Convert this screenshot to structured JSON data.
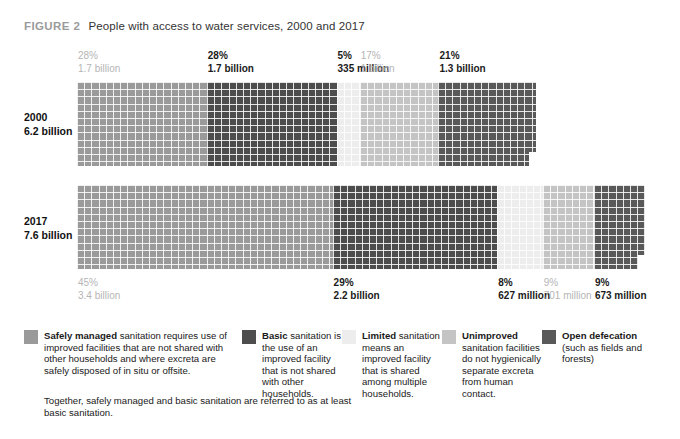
{
  "figure": {
    "label": "FIGURE 2",
    "title": "People with access to water services, 2000 and 2017"
  },
  "colors": {
    "safely_managed": "#9a9a9a",
    "basic": "#4d4d4d",
    "limited": "#ededed",
    "unimproved": "#c4c4c4",
    "open_defecation": "#595959",
    "grid_line": "#ffffff",
    "muted_text": "#b5b5b5",
    "body_text": "#1a1a1a",
    "fig_label": "#9b9b9b"
  },
  "rows": [
    {
      "year": "2000",
      "total": "6.2 billion",
      "labels_position": "top",
      "segments": [
        {
          "key": "safely_managed",
          "label_pct": "28%",
          "label_num": "1.7 billion",
          "value": 28,
          "muted": true
        },
        {
          "key": "basic",
          "label_pct": "28%",
          "label_num": "1.7 billion",
          "value": 28,
          "muted": false
        },
        {
          "key": "limited",
          "label_pct": "5%",
          "label_num": "335 million",
          "value": 5,
          "muted": false
        },
        {
          "key": "unimproved",
          "label_pct": "17%",
          "label_num": "1 billion",
          "value": 17,
          "muted": true
        },
        {
          "key": "open_defecation",
          "label_pct": "21%",
          "label_num": "1.3 billion",
          "value": 21,
          "muted": false
        }
      ]
    },
    {
      "year": "2017",
      "total": "7.6 billion",
      "labels_position": "bottom",
      "segments": [
        {
          "key": "safely_managed",
          "label_pct": "45%",
          "label_num": "3.4 billion",
          "value": 45,
          "muted": true
        },
        {
          "key": "basic",
          "label_pct": "29%",
          "label_num": "2.2 billion",
          "value": 29,
          "muted": false
        },
        {
          "key": "limited",
          "label_pct": "8%",
          "label_num": "627 million",
          "value": 8,
          "muted": false
        },
        {
          "key": "unimproved",
          "label_pct": "9%",
          "label_num": "701 million",
          "value": 9,
          "muted": true
        },
        {
          "key": "open_defecation",
          "label_pct": "9%",
          "label_num": "673 million",
          "value": 9,
          "muted": false
        }
      ]
    }
  ],
  "legend": [
    {
      "key": "safely_managed",
      "color": "#9a9a9a",
      "bold": "Safely managed",
      "rest": "",
      "body": "sanitation requires use of improved facilities that are not shared with other households and where excreta are safely disposed of in situ or offsite."
    },
    {
      "key": "basic",
      "color": "#4d4d4d",
      "bold": "Basic",
      "rest": " sanitation",
      "body": "is the use of an improved facility that is not shared with other households."
    },
    {
      "key": "limited",
      "color": "#ededed",
      "bold": "Limited",
      "rest": " sanitation",
      "body": "means an improved facility that is shared among multiple households."
    },
    {
      "key": "unimproved",
      "color": "#c4c4c4",
      "bold": "Unimproved",
      "rest": "",
      "body": "sanitation facilities do not hygienically separate excreta from human contact."
    },
    {
      "key": "open_defecation",
      "color": "#595959",
      "bold": "Open defecation",
      "rest": "",
      "body": "(such as fields and forests)"
    }
  ],
  "legend_note": "Together, safely managed and basic sanitation are referred to as at least basic sanitation.",
  "chart_data": {
    "type": "bar",
    "title": "People with access to water services, 2000 and 2017",
    "xlabel": "",
    "ylabel": "",
    "orientation": "horizontal-stacked-waffle",
    "categories": [
      "2000",
      "2017"
    ],
    "category_totals": [
      "6.2 billion",
      "7.6 billion"
    ],
    "series": [
      {
        "name": "Safely managed",
        "values": [
          28,
          45
        ],
        "labels": [
          "1.7 billion",
          "3.4 billion"
        ],
        "color": "#9a9a9a"
      },
      {
        "name": "Basic",
        "values": [
          28,
          29
        ],
        "labels": [
          "1.7 billion",
          "2.2 billion"
        ],
        "color": "#4d4d4d"
      },
      {
        "name": "Limited",
        "values": [
          5,
          8
        ],
        "labels": [
          "335 million",
          "627 million"
        ],
        "color": "#ededed"
      },
      {
        "name": "Unimproved",
        "values": [
          17,
          9
        ],
        "labels": [
          "1 billion",
          "701 million"
        ],
        "color": "#c4c4c4"
      },
      {
        "name": "Open defecation",
        "values": [
          21,
          9
        ],
        "labels": [
          "1.3 billion",
          "673 million"
        ],
        "color": "#595959"
      }
    ],
    "unit": "percent of world population",
    "xlim": [
      0,
      100
    ],
    "grid": false,
    "legend_position": "bottom",
    "bar_widths_relative": {
      "2000": 0.816,
      "2017": 1.0
    }
  }
}
